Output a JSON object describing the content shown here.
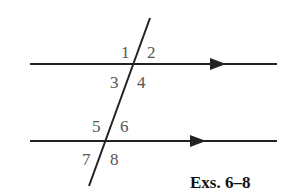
{
  "diagram": {
    "caption": "Exs. 6–8",
    "angle_labels": [
      "1",
      "2",
      "3",
      "4",
      "5",
      "6",
      "7",
      "8"
    ],
    "lines": {
      "top_parallel": {
        "x1": 30,
        "y1": 64,
        "x2": 277,
        "y2": 64,
        "arrow_x": 224
      },
      "bottom_parallel": {
        "x1": 30,
        "y1": 141,
        "x2": 277,
        "y2": 141,
        "arrow_x": 205
      },
      "transversal": {
        "x1": 150,
        "y1": 18,
        "x2": 89,
        "y2": 186
      }
    },
    "colors": {
      "line": "#222222",
      "label": "#555555",
      "caption": "#111111"
    }
  }
}
